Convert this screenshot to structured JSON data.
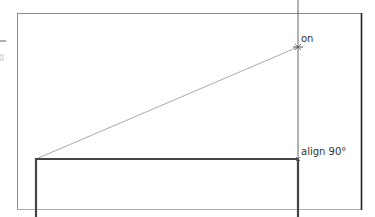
{
  "diagram": {
    "labels": {
      "on": "on",
      "align": "align 90°"
    },
    "colors": {
      "frame": "#888888",
      "frame_right": "#333333",
      "guide": "#555555",
      "rect": "#444444",
      "diagonal": "#999999"
    }
  }
}
